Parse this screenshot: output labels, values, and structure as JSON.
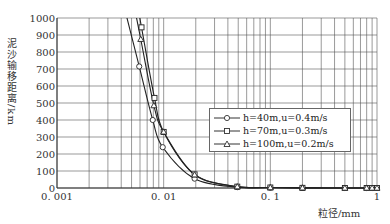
{
  "chart_data": {
    "type": "line",
    "title": "",
    "xlabel": "粒径/mm",
    "ylabel": "泥沙输移距离/km",
    "xscale": "log",
    "xlim": [
      0.001,
      1
    ],
    "ylim": [
      0,
      1000
    ],
    "x_ticks": [
      "0.001",
      "0.01",
      "0.1",
      "1"
    ],
    "y_ticks": [
      "0",
      "100",
      "200",
      "300",
      "400",
      "500",
      "600",
      "700",
      "800",
      "900",
      "1000"
    ],
    "grid": true,
    "legend_position": "center-right",
    "series": [
      {
        "name": "h=40m,u=0.4m/s",
        "marker": "circle",
        "x": [
          0.0059,
          0.0079,
          0.0098,
          0.0195,
          0.049,
          0.1,
          0.2,
          0.5,
          0.8,
          0.9,
          1.0
        ],
        "y": [
          715,
          400,
          240,
          55,
          5,
          2,
          1,
          0,
          0,
          0,
          0
        ]
      },
      {
        "name": "h=70m,u=0.3m/s",
        "marker": "square",
        "x": [
          0.0062,
          0.0082,
          0.01,
          0.0195,
          0.049,
          0.1,
          0.2,
          0.5,
          0.8,
          0.9,
          1.0
        ],
        "y": [
          945,
          530,
          330,
          80,
          8,
          3,
          1,
          0,
          0,
          0,
          0
        ]
      },
      {
        "name": "h=100m,u=0.2m/s",
        "marker": "triangle",
        "x": [
          0.0061,
          0.0081,
          0.01,
          0.0195,
          0.049,
          0.1,
          0.2,
          0.5,
          0.8,
          0.9,
          1.0
        ],
        "y": [
          875,
          485,
          330,
          78,
          8,
          3,
          1,
          0,
          0,
          0,
          0
        ]
      }
    ]
  },
  "legend": {
    "items": [
      {
        "label": "h=40m,u=0.4m/s",
        "marker": "circle"
      },
      {
        "label": "h=70m,u=0.3m/s",
        "marker": "square"
      },
      {
        "label": "h=100m,u=0.2m/s",
        "marker": "triangle"
      }
    ]
  },
  "axes": {
    "xlabel": "粒径/mm",
    "ylabel": "泥沙输移距离/km"
  }
}
